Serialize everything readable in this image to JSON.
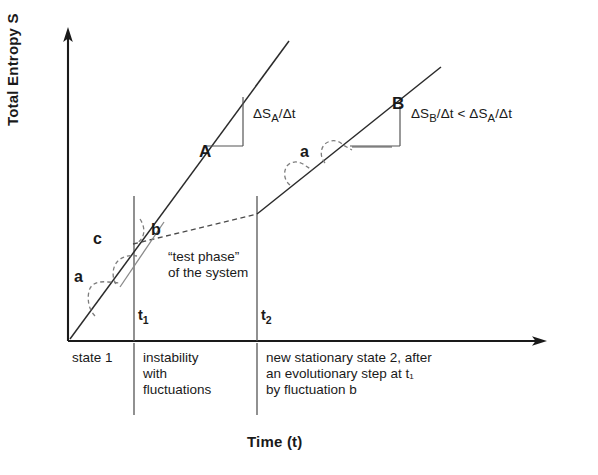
{
  "figure": {
    "kind": "entropy-evolution-diagram",
    "axes": {
      "y_title": "Total Entropy S",
      "x_title": "Time (t)"
    },
    "ticks": [
      {
        "name": "t1",
        "label": "t",
        "sub": "1"
      },
      {
        "name": "t2",
        "label": "t",
        "sub": "2"
      }
    ],
    "curves": [
      {
        "name": "A",
        "label": "A"
      },
      {
        "name": "B",
        "label": "B"
      }
    ],
    "slope_annotations": [
      {
        "name": "slope-a",
        "text": "ΔS",
        "sub": "A",
        "rest": "/Δt"
      },
      {
        "name": "slope-b",
        "text": "ΔS",
        "sub": "B",
        "rest": "/Δt < ΔS",
        "sub2": "A",
        "rest2": "/Δt"
      }
    ],
    "fluctuations": [
      {
        "name": "fluctuation-a-left",
        "label": "a"
      },
      {
        "name": "fluctuation-c",
        "label": "c"
      },
      {
        "name": "fluctuation-b",
        "label": "b"
      },
      {
        "name": "fluctuation-a-right",
        "label": "a"
      }
    ],
    "plot_note": {
      "line1": "“test phase”",
      "line2": "of the system"
    },
    "table": {
      "columns": [
        {
          "name": "state-1-cell",
          "lines": [
            "state 1"
          ]
        },
        {
          "name": "instability-cell",
          "lines": [
            "instability",
            "with",
            "fluctuations"
          ]
        },
        {
          "name": "new-state-cell",
          "lines": [
            "new stationary state 2, after",
            "an evolutionary step at t₁",
            "by fluctuation b"
          ]
        }
      ]
    },
    "colors": {
      "ink": "#1a1a1a",
      "line": "#2b2b2b",
      "rule": "#555555",
      "dashed": "#7d7d7d",
      "background": "#ffffff"
    }
  }
}
